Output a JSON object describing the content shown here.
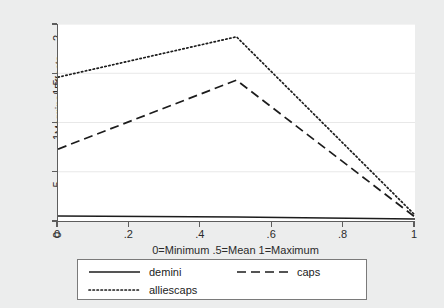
{
  "chart_data": {
    "type": "line",
    "title": "",
    "subtitle": "",
    "xlabel": "0=Minimum .5=Mean 1=Maximum",
    "ylabel": "Marginal Effects",
    "xlim": [
      0,
      1
    ],
    "ylim": [
      0,
      2
    ],
    "xticks": [
      "0",
      ".2",
      ".4",
      ".6",
      ".8",
      "1"
    ],
    "xtick_values": [
      0,
      0.2,
      0.4,
      0.6,
      0.8,
      1
    ],
    "yticks": [
      "0",
      ".5",
      "1",
      "1.5",
      "2"
    ],
    "ytick_values": [
      0,
      0.5,
      1,
      1.5,
      2
    ],
    "grid": "horizontal",
    "legend_position": "below",
    "x": [
      0,
      0.5,
      1
    ],
    "series": [
      {
        "name": "demini",
        "style": "solid",
        "color": "#1c1c1c",
        "values": [
          0.05,
          0.04,
          0.02
        ]
      },
      {
        "name": "caps",
        "style": "dashed",
        "color": "#1c1c1c",
        "values": [
          0.73,
          1.43,
          0.04
        ]
      },
      {
        "name": "alliescaps",
        "style": "dotted",
        "color": "#1c1c1c",
        "values": [
          1.46,
          1.87,
          0.06
        ]
      }
    ]
  },
  "legend": {
    "entries": [
      {
        "label": "demini",
        "key": "solid-line-key"
      },
      {
        "label": "caps",
        "key": "dashed-line-key"
      },
      {
        "label": "alliescaps",
        "key": "dotted-line-key"
      }
    ]
  },
  "colors": {
    "background": "#eceded",
    "plot_background": "#ffffff",
    "axis": "#5d5d5d",
    "gridline": "#e8e8e8",
    "line": "#1c1c1c",
    "legend_border": "#7a7a7a"
  }
}
